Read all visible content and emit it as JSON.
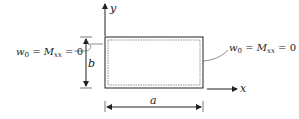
{
  "diagram": {
    "axes": {
      "y_label": "y",
      "x_label": "x"
    },
    "dimensions": {
      "width_label": "a",
      "height_label": "b"
    },
    "left_bc": {
      "w": "w",
      "w_sub": "0",
      "eq1": " = ",
      "M": "M",
      "M_sub": "xx",
      "eq2": " = 0"
    },
    "right_bc": {
      "w": "w",
      "w_sub": "0",
      "eq1": " = ",
      "M": "M",
      "M_sub": "xx",
      "eq2": " = 0"
    },
    "colors": {
      "line": "#222222",
      "dashed": "#777777"
    }
  }
}
